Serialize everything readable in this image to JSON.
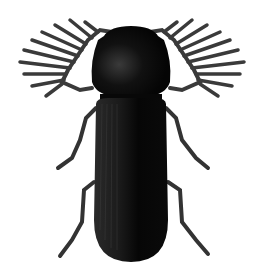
{
  "image": {
    "subject": "beetle illustration",
    "description": "Black beetle with comb-like (pectinate) antennae, dorsal view",
    "colors": {
      "background": "#ffffff",
      "body": "#0a0a0a",
      "legs": "#333333",
      "texture": "#4a4a4a"
    }
  }
}
